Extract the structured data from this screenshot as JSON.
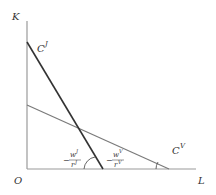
{
  "diagram": {
    "axes": {
      "y_label": "K",
      "x_label": "L",
      "origin_label": "O",
      "color": "#9a9a9a"
    },
    "lines": [
      {
        "name": "C",
        "sup": "J",
        "color": "#333333"
      },
      {
        "name": "C",
        "sup": "V",
        "color": "#7a7a7a"
      }
    ],
    "slope_labels": [
      {
        "sign": "−",
        "num": "w",
        "num_sup": "J",
        "den": "r",
        "den_sup": "J"
      },
      {
        "sign": "−",
        "num": "w",
        "num_sup": "V",
        "den": "r",
        "den_sup": "V"
      }
    ]
  }
}
